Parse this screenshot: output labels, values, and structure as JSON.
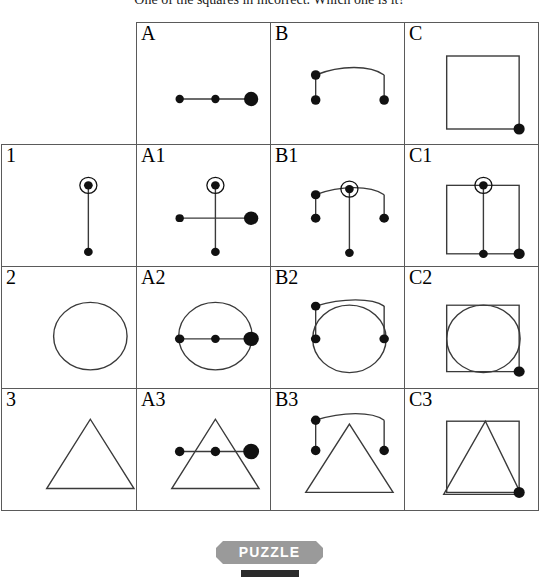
{
  "question": "One of the squares in incorrect.  Which one is it?",
  "badge": {
    "label": "PUZZLE"
  },
  "grid": {
    "column_headers": [
      "",
      "A",
      "B",
      "C"
    ],
    "row_headers": [
      "1",
      "2",
      "3"
    ],
    "cells": [
      {
        "id": "corner",
        "label": "",
        "shapes": []
      },
      {
        "id": "A",
        "label": "A",
        "shapes": [
          "dotted-line"
        ]
      },
      {
        "id": "B",
        "label": "B",
        "shapes": [
          "arch"
        ]
      },
      {
        "id": "C",
        "label": "C",
        "shapes": [
          "square-with-corner-dot"
        ]
      },
      {
        "id": "1",
        "label": "1",
        "shapes": [
          "vertical-stem"
        ]
      },
      {
        "id": "A1",
        "label": "A1",
        "shapes": [
          "dotted-line",
          "vertical-stem"
        ]
      },
      {
        "id": "B1",
        "label": "B1",
        "shapes": [
          "arch",
          "vertical-stem"
        ]
      },
      {
        "id": "C1",
        "label": "C1",
        "shapes": [
          "square-with-corner-dot",
          "vertical-stem"
        ]
      },
      {
        "id": "2",
        "label": "2",
        "shapes": [
          "circle"
        ]
      },
      {
        "id": "A2",
        "label": "A2",
        "shapes": [
          "circle",
          "dotted-line"
        ]
      },
      {
        "id": "B2",
        "label": "B2",
        "shapes": [
          "circle",
          "arch"
        ]
      },
      {
        "id": "C2",
        "label": "C2",
        "shapes": [
          "square-with-corner-dot",
          "circle"
        ]
      },
      {
        "id": "3",
        "label": "3",
        "shapes": [
          "triangle"
        ]
      },
      {
        "id": "A3",
        "label": "A3",
        "shapes": [
          "triangle",
          "dotted-line"
        ]
      },
      {
        "id": "B3",
        "label": "B3",
        "shapes": [
          "triangle",
          "arch"
        ]
      },
      {
        "id": "C3",
        "label": "C3",
        "shapes": [
          "square-with-corner-dot",
          "triangle-oversized"
        ]
      }
    ]
  },
  "colors": {
    "stroke": "#3a3a3a",
    "dot_fill": "#111111",
    "grid_border": "#5a5a5a",
    "badge_bg": "#9a9a9a",
    "badge_text": "#ffffff"
  }
}
